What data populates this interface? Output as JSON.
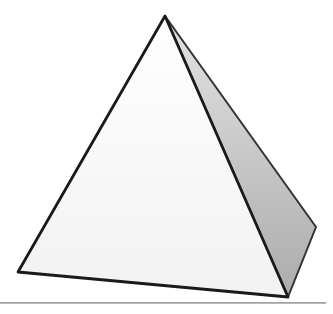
{
  "figure": {
    "type": "pyramid-line-drawing",
    "background": "#ffffff",
    "pyramid": {
      "apex": "165,16",
      "front_face": {
        "points": "165,16 18,272 288,297",
        "fill_top": "#ffffff",
        "fill_bottom": "#f2f2f2",
        "stroke": "#1a1a1a",
        "stroke_width": "2.8"
      },
      "right_face": {
        "points": "165,16 316,227 288,297",
        "fill_top": "#e3e3e3",
        "fill_bottom": "#acacac",
        "stroke": "#333333",
        "stroke_width": "2"
      }
    },
    "ground_line": {
      "x1": "0",
      "y1": "302.8",
      "x2": "326",
      "y2": "302.8",
      "stroke": "#a2a2a2",
      "stroke_width": "1.8"
    }
  }
}
